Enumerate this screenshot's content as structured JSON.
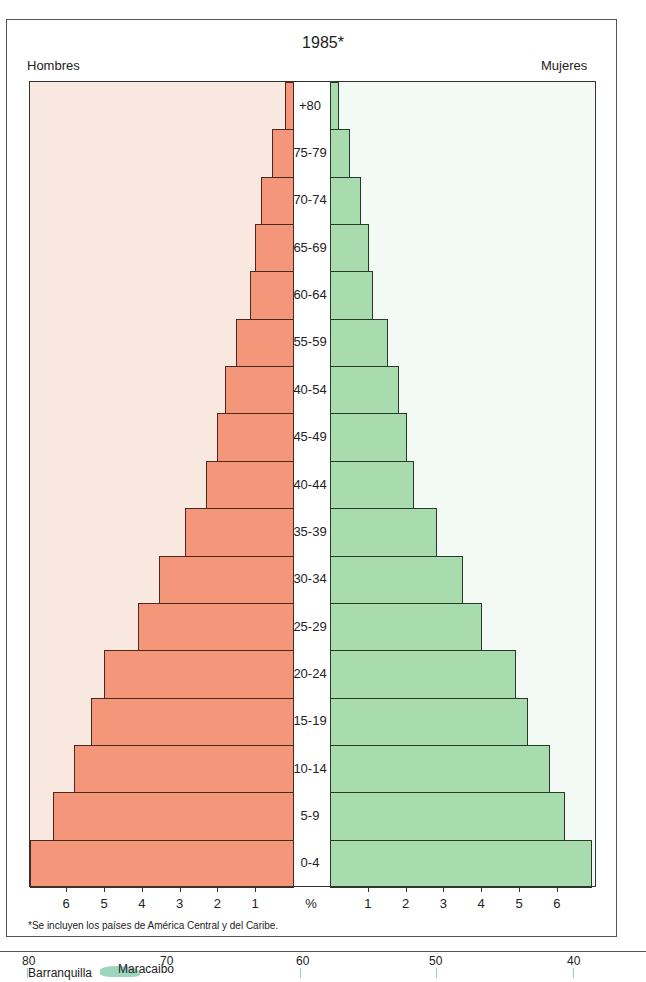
{
  "title": "1985*",
  "left_label": "Hombres",
  "right_label": "Mujeres",
  "axis_unit_label": "%",
  "footnote": "*Se incluyen los países de América Central y del Caribe.",
  "colors": {
    "male_bar": "#f4967a",
    "female_bar": "#a8dcae",
    "male_panel": "#f8e8e0",
    "female_panel": "#f3faf5"
  },
  "chart_data": {
    "type": "bar",
    "subtype": "population-pyramid",
    "title": "1985*",
    "xlabel": "%",
    "ylabel": "",
    "xlim": [
      0,
      7
    ],
    "grid": false,
    "legend_position": "top (Hombres left, Mujeres right)",
    "categories": [
      "+80",
      "75-79",
      "70-74",
      "65-69",
      "60-64",
      "55-59",
      "40-54",
      "45-49",
      "40-44",
      "35-39",
      "30-34",
      "25-29",
      "20-24",
      "15-19",
      "10-14",
      "5-9",
      "0-4"
    ],
    "series": [
      {
        "name": "Hombres",
        "values": [
          0.2,
          0.55,
          0.85,
          1.0,
          1.15,
          1.5,
          1.8,
          2.0,
          2.3,
          2.85,
          3.55,
          4.1,
          5.0,
          5.35,
          5.8,
          6.35,
          7.0
        ]
      },
      {
        "name": "Mujeres",
        "values": [
          0.2,
          0.5,
          0.8,
          1.0,
          1.1,
          1.5,
          1.8,
          2.0,
          2.2,
          2.8,
          3.5,
          4.0,
          4.9,
          5.2,
          5.8,
          6.2,
          6.9
        ]
      }
    ],
    "left_ticks": [
      "6",
      "5",
      "4",
      "3",
      "2",
      "1"
    ],
    "right_ticks": [
      "1",
      "2",
      "3",
      "4",
      "5",
      "6"
    ],
    "footnote": "*Se incluyen los países de América Central y del Caribe."
  },
  "map_fragment": {
    "longitude_labels": [
      "80",
      "70",
      "60",
      "50",
      "40"
    ],
    "place_labels": [
      "Barranquilla",
      "Maracaibo"
    ]
  }
}
